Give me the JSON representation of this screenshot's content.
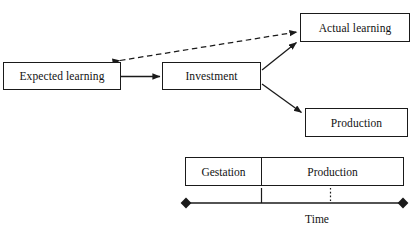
{
  "diagram": {
    "title_text_present": false,
    "nodes": [
      {
        "id": "expected_learning",
        "label": "Expected learning"
      },
      {
        "id": "investment",
        "label": "Investment"
      },
      {
        "id": "actual_learning",
        "label": "Actual learning"
      },
      {
        "id": "production",
        "label": "Production"
      }
    ],
    "edges": [
      {
        "from": "expected_learning",
        "to": "investment",
        "style": "solid",
        "arrows": "single"
      },
      {
        "from": "investment",
        "to": "actual_learning",
        "style": "solid",
        "arrows": "single"
      },
      {
        "from": "investment",
        "to": "production",
        "style": "solid",
        "arrows": "single"
      },
      {
        "from": "actual_learning",
        "to": "expected_learning",
        "style": "dashed",
        "arrows": "double"
      }
    ],
    "timeline": {
      "phases": [
        {
          "id": "gestation",
          "label": "Gestation"
        },
        {
          "id": "production",
          "label": "Production"
        }
      ],
      "axis_label": "Time",
      "axis_endpoint_marker": "filled-diamond",
      "ticks": [
        {
          "id": "gestation-end-tick",
          "style": "solid"
        },
        {
          "id": "production-mid-tick",
          "style": "dotted"
        }
      ]
    },
    "colors": {
      "stroke": "#1a1a1a",
      "text": "#121212",
      "background": "#ffffff"
    }
  }
}
